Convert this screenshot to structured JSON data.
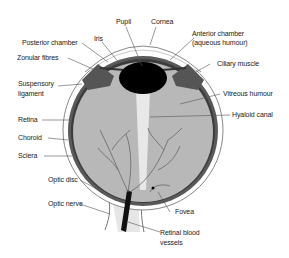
{
  "diagram": {
    "labels": {
      "pupil": "Pupil",
      "cornea": "Cornea",
      "iris": "Iris",
      "posterior_chamber": "Posterior chamber",
      "anterior_chamber_1": "Anterior chamber",
      "anterior_chamber_2": "(aqueous humour)",
      "zonular_fibres": "Zonular fibres",
      "ciliary_muscle": "Ciliary muscle",
      "suspensory_1": "Suspensory",
      "suspensory_2": "ligament",
      "vitreous_humour": "Vitreous humour",
      "hyaloid_canal": "Hyaloid canal",
      "retina": "Retina",
      "choroid": "Choroid",
      "sclera": "Sclera",
      "optic_disc": "Optic disc",
      "optic_nerve": "Optic nerve",
      "fovea": "Fovea",
      "retinal_vessels_1": "Retinal blood",
      "retinal_vessels_2": "vessels"
    },
    "colors": {
      "vitreous": "#b8b8b8",
      "sclera": "#ffffff",
      "choroid": "#3a3a3a",
      "lens": "#000000",
      "leader": "#555555"
    }
  }
}
